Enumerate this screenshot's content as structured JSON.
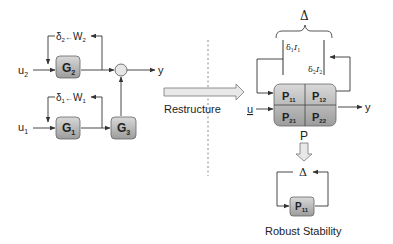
{
  "left_diagram": {
    "inputs": [
      {
        "name": "u",
        "sub": "2"
      },
      {
        "name": "u",
        "sub": "1"
      }
    ],
    "blocks": [
      {
        "name": "G",
        "sub": "2"
      },
      {
        "name": "G",
        "sub": "1"
      },
      {
        "name": "G",
        "sub": "3"
      }
    ],
    "feedback_labels": [
      {
        "delta": "δ",
        "delta_sub": "2",
        "arrow": "←",
        "weight": "W",
        "weight_sub": "2"
      },
      {
        "delta": "δ",
        "delta_sub": "1",
        "arrow": "←",
        "weight": "W",
        "weight_sub": "1"
      }
    ],
    "output": "y"
  },
  "transform": {
    "label": "Restructure"
  },
  "right_diagram": {
    "uncertainty_symbol": "Δ",
    "uncertainty_entries": [
      {
        "text": "δ",
        "sub": "1",
        "suffix": "I",
        "suffix_sub": "1"
      },
      {
        "text": "δ",
        "sub": "2",
        "suffix": "I",
        "suffix_sub": "2"
      }
    ],
    "input": "u",
    "output": "y",
    "matrix": [
      {
        "name": "P",
        "sub": "11"
      },
      {
        "name": "P",
        "sub": "12"
      },
      {
        "name": "P",
        "sub": "21"
      },
      {
        "name": "P",
        "sub": "22"
      }
    ],
    "matrix_label": "P"
  },
  "robust_loop": {
    "uncertainty_symbol": "Δ",
    "block": {
      "name": "P",
      "sub": "11"
    },
    "caption": "Robust Stability"
  },
  "colors": {
    "block_fill_top": "#d6d6d6",
    "block_fill_bottom": "#9a9a9a",
    "line": "#333333",
    "dashed": "#888888",
    "arrow_fill": "#e8e8e8"
  }
}
